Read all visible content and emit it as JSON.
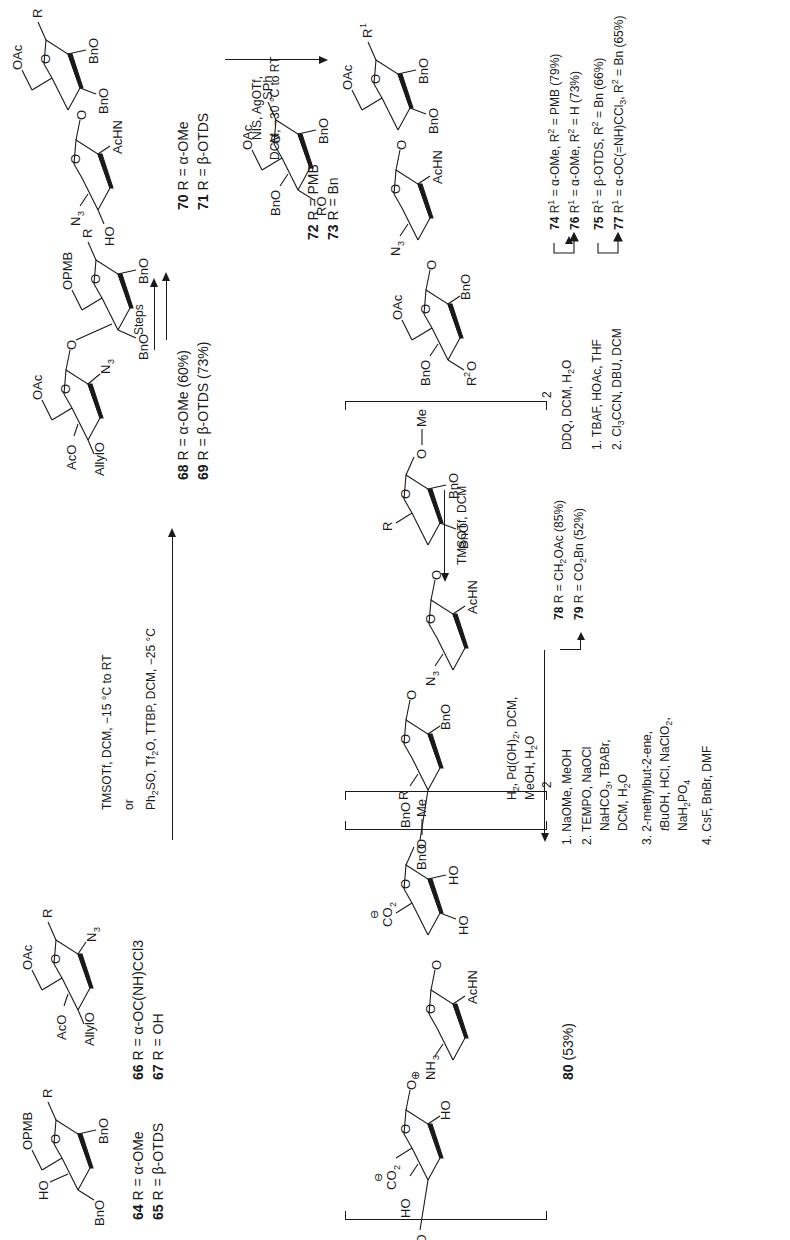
{
  "scheme": {
    "orientation": "rotated 90 degrees counter-clockwise",
    "compounds": {
      "c64_65": {
        "substituents": [
          "HO",
          "OPMB",
          "BnO",
          "BnO",
          "R"
        ],
        "labels": [
          {
            "num": "64",
            "text": "R = α-OMe"
          },
          {
            "num": "65",
            "text": "R = β-OTDS"
          }
        ]
      },
      "c66_67": {
        "substituents": [
          "OAc",
          "AcO",
          "AllylO",
          "N3",
          "R"
        ],
        "labels": [
          {
            "num": "66",
            "text": "R = α-OC(NH)CCl3"
          },
          {
            "num": "67",
            "text": "R = OH"
          }
        ]
      },
      "c68_69": {
        "substituents": [
          "OAc",
          "AcO",
          "AllylO",
          "N3",
          "OPMB",
          "BnO",
          "BnO",
          "R"
        ],
        "labels": [
          {
            "num": "68",
            "text": "R = α-OMe (60%)"
          },
          {
            "num": "69",
            "text": "R = β-OTDS (73%)"
          }
        ]
      },
      "c70_71": {
        "substituents": [
          "N3",
          "HO",
          "AcHN",
          "OAc",
          "BnO",
          "BnO",
          "R"
        ],
        "labels": [
          {
            "num": "70",
            "text": "R = α-OMe"
          },
          {
            "num": "71",
            "text": "R = β-OTDS"
          }
        ]
      },
      "c72_73": {
        "substituents": [
          "OAc",
          "BnO",
          "RO",
          "BnO",
          "SPh"
        ],
        "labels": [
          {
            "num": "72",
            "text": "R = PMB"
          },
          {
            "num": "73",
            "text": "R = Bn"
          }
        ]
      },
      "c74_77": {
        "substituents": [
          "OAc",
          "BnO",
          "R2O",
          "BnO",
          "N3",
          "AcHN",
          "OAc",
          "BnO",
          "BnO",
          "R1"
        ],
        "labels": [
          {
            "num": "74",
            "text": "R1 = α-OMe, R2 = PMB (79%)"
          },
          {
            "num": "76",
            "text": "R1 = α-OMe, R2 = H (73%)"
          },
          {
            "num": "75",
            "text": "R1 = β-OTDS, R2 = Bn (66%)"
          },
          {
            "num": "77",
            "text": "R1 = α-OC(=NH)CCl3, R2 = Bn (65%)"
          }
        ]
      },
      "c78_79": {
        "substituents": [
          "BnO",
          "R",
          "BnO",
          "BnO",
          "N3",
          "AcHN",
          "R",
          "BnO",
          "BnO",
          "O",
          "Me"
        ],
        "repeat": "2",
        "labels": [
          {
            "num": "78",
            "text": "R = CH2OAc (85%)"
          },
          {
            "num": "79",
            "text": "R = CO2Bn (52%)"
          }
        ]
      },
      "c80": {
        "substituents": [
          "HO",
          "HO",
          "CO2−",
          "HO",
          "NH3+",
          "AcHN",
          "CO2−",
          "HO",
          "HO",
          "O",
          "Me"
        ],
        "repeat": "2",
        "labels": [
          {
            "num": "80",
            "text": "(53%)"
          }
        ]
      }
    },
    "reagents": {
      "glycosylation_1": {
        "line1": "TMSOTf, DCM, −15 °C to RT",
        "line2": "or",
        "line3": "Ph2SO, Tf2O, TTBP, DCM, −25 °C"
      },
      "steps": "Steps",
      "glycosylation_2": {
        "line1": "NIS, AgOTf,",
        "line2": "DCM, −30 °C to RT"
      },
      "ddq": "DDQ, DCM, H2O",
      "activation": {
        "step1": "1. TBAF, HOAc, THF",
        "step2": "2. Cl3CCN, DBU, DCM"
      },
      "dimerization": "TMSOTf, DCM",
      "oxidation": {
        "step1": "1. NaOMe, MeOH",
        "step2a": "2. TEMPO, NaOCl",
        "step2b": "NaHCO3, TBABr,",
        "step2c": "DCM, H2O",
        "step3a": "3. 2-methylbut-2-ene,",
        "step3b": "tBuOH, HCl, NaClO2,",
        "step3c": "NaH2PO4",
        "step4": "4. CsF, BnBr, DMF"
      },
      "deprotection": {
        "line1": "H2, Pd(OH)2, DCM,",
        "line2": "MeOH, H2O"
      }
    }
  }
}
